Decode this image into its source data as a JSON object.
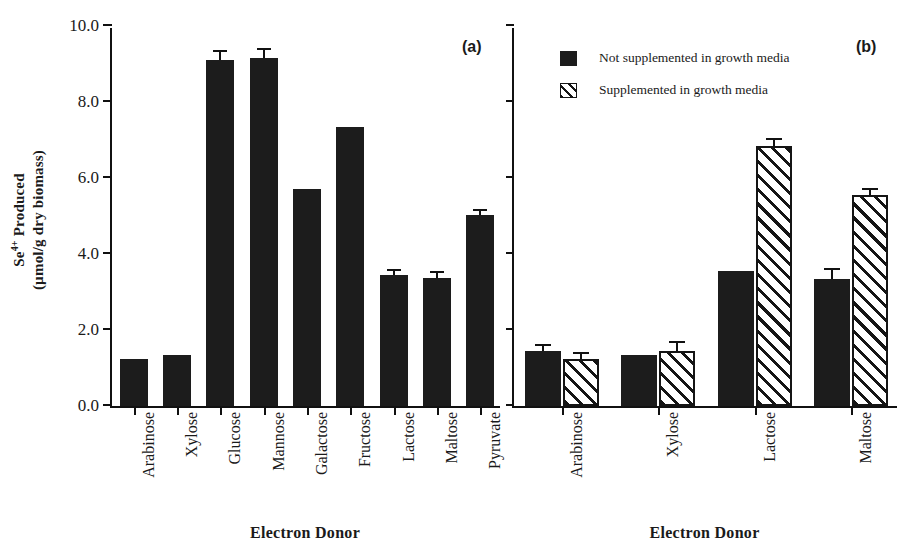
{
  "figure": {
    "y_axis_title_line1": "Se4+ Produced",
    "y_axis_title_line2": "(µmol/g dry biomass)",
    "y_axis_title_plain": "Se4+ Produced (µmol/g dry biomass)",
    "y_superscript": "4+",
    "y_base": "Se",
    "background": "#ffffff",
    "bar_color_solid": "#1c1c1c",
    "bar_color_hatch": "#ffffff",
    "axis_color": "#111111"
  },
  "panel_a": {
    "tag": "(a)",
    "xlabel": "Electron Donor",
    "ytick_labels": [
      "0.0",
      "2.0",
      "4.0",
      "6.0",
      "8.0",
      "10.0"
    ]
  },
  "panel_b": {
    "tag": "(b)",
    "xlabel": "Electron Donor",
    "legend": [
      {
        "label": "Not supplemented in growth media",
        "style": "solid"
      },
      {
        "label": "Supplemented in growth media",
        "style": "hatch"
      }
    ]
  },
  "chart_data": [
    {
      "type": "bar",
      "panel": "(a)",
      "title": "",
      "xlabel": "Electron Donor",
      "ylabel": "Se4+ Produced (µmol/g dry biomass)",
      "ylim": [
        0.0,
        10.0
      ],
      "yticks": [
        0.0,
        2.0,
        4.0,
        6.0,
        8.0,
        10.0
      ],
      "grid": false,
      "legend": "none",
      "categories": [
        "Arabinose",
        "Xylose",
        "Glucose",
        "Mannose",
        "Galactose",
        "Fructose",
        "Lactose",
        "Maltose",
        "Pyruvate"
      ],
      "values": [
        1.25,
        1.33,
        9.1,
        9.15,
        5.7,
        7.35,
        3.45,
        3.37,
        5.02
      ],
      "errors": [
        0.0,
        0.0,
        0.22,
        0.22,
        0.0,
        0.0,
        0.1,
        0.12,
        0.12
      ]
    },
    {
      "type": "bar",
      "panel": "(b)",
      "title": "",
      "xlabel": "Electron Donor",
      "ylabel": "Se4+ Produced (µmol/g dry biomass)",
      "ylim": [
        0.0,
        10.0
      ],
      "yticks": [
        0.0,
        2.0,
        4.0,
        6.0,
        8.0,
        10.0
      ],
      "grid": false,
      "legend": "top-left",
      "categories": [
        "Arabinose",
        "Xylose",
        "Lactose",
        "Maltose"
      ],
      "series": [
        {
          "name": "Not supplemented in growth media",
          "style": "solid",
          "values": [
            1.45,
            1.35,
            3.55,
            3.35
          ],
          "errors": [
            0.13,
            0.0,
            0.0,
            0.22
          ]
        },
        {
          "name": "Supplemented in growth media",
          "style": "hatch",
          "values": [
            1.25,
            1.45,
            6.85,
            5.55
          ],
          "errors": [
            0.12,
            0.22,
            0.15,
            0.13
          ]
        }
      ]
    }
  ]
}
